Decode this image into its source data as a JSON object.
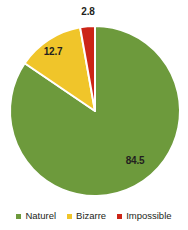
{
  "chart_data": {
    "type": "pie",
    "title": "",
    "categories": [
      "Naturel",
      "Bizarre",
      "Impossible"
    ],
    "values": [
      84.5,
      12.7,
      2.8
    ],
    "labels": [
      "84.5",
      "12.7",
      "2.8"
    ],
    "colors": [
      "#6d9a3c",
      "#f0c52a",
      "#cc2517"
    ],
    "legend_position": "bottom",
    "grid": false,
    "start_angle_deg": -90,
    "direction": "clockwise",
    "slice_separator_color": "#ffffff",
    "background": "#ffffff",
    "label_color": "#231f20"
  },
  "legend": {
    "items": [
      {
        "label": "Naturel",
        "color": "#6d9a3c",
        "swatch": "legend-swatch-square"
      },
      {
        "label": "Bizarre",
        "color": "#f0c52a",
        "swatch": "legend-swatch-square"
      },
      {
        "label": "Impossible",
        "color": "#cc2517",
        "swatch": "legend-swatch-square"
      }
    ]
  },
  "data_labels": {
    "naturel": "84.5",
    "bizarre": "12.7",
    "impossible": "2.8"
  }
}
